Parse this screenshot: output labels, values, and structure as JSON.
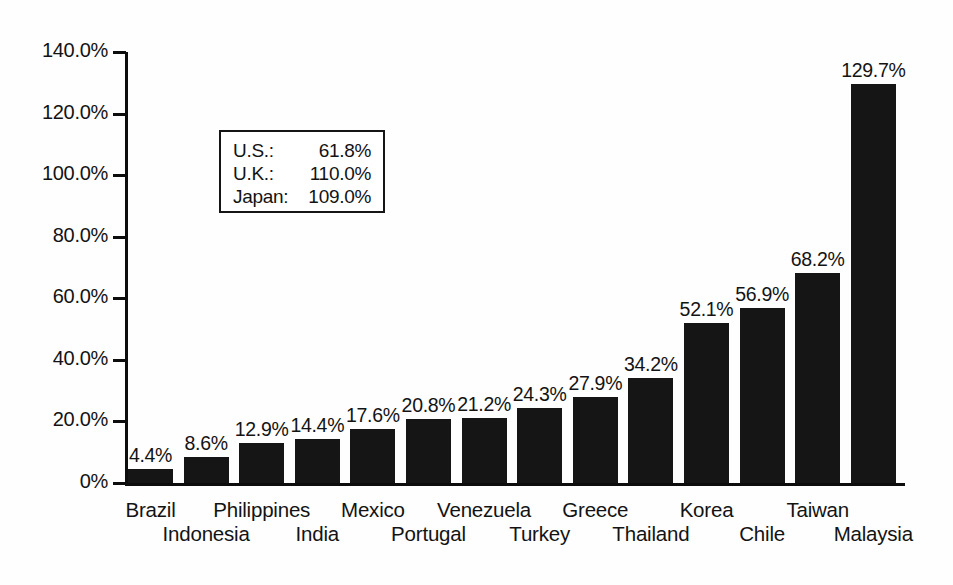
{
  "chart_data": {
    "type": "bar",
    "title": "",
    "subtitle": "",
    "xlabel": "",
    "ylabel": "",
    "grid": false,
    "legend_position": "inside-upper-left",
    "ylim": [
      0,
      140
    ],
    "ytick_values": [
      0,
      20,
      40,
      60,
      80,
      100,
      120,
      140
    ],
    "ytick_labels": [
      "0%",
      "20.0%",
      "40.0%",
      "60.0%",
      "80.0%",
      "100.0%",
      "120.0%",
      "140.0%"
    ],
    "categories": [
      "Brazil",
      "Indonesia",
      "Philippines",
      "India",
      "Mexico",
      "Portugal",
      "Venezuela",
      "Turkey",
      "Greece",
      "Thailand",
      "Korea",
      "Chile",
      "Taiwan",
      "Malaysia"
    ],
    "values": [
      4.4,
      8.6,
      12.9,
      14.4,
      17.6,
      20.8,
      21.2,
      24.3,
      27.9,
      34.2,
      52.1,
      56.9,
      68.2,
      129.7
    ],
    "data_labels": [
      "4.4%",
      "8.6%",
      "12.9%",
      "14.4%",
      "17.6%",
      "20.8%",
      "21.2%",
      "24.3%",
      "27.9%",
      "34.2%",
      "52.1%",
      "56.9%",
      "68.2%",
      "129.7%"
    ],
    "bar_color": "#151515",
    "axis_color": "#0d0d0d",
    "annotations": [
      {
        "name": "U.S.:",
        "value": "61.8%"
      },
      {
        "name": "U.K.:",
        "value": "110.0%"
      },
      {
        "name": "Japan:",
        "value": "109.0%"
      }
    ]
  }
}
